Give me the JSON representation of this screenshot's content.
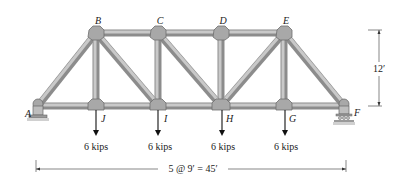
{
  "diagram": {
    "nodes": {
      "A": {
        "label": "A",
        "x": 38,
        "y": 106
      },
      "B": {
        "label": "B",
        "x": 96,
        "y": 33
      },
      "C": {
        "label": "C",
        "x": 158,
        "y": 33
      },
      "D": {
        "label": "D",
        "x": 221,
        "y": 33
      },
      "E": {
        "label": "E",
        "x": 284,
        "y": 33
      },
      "F": {
        "label": "F",
        "x": 344,
        "y": 106
      },
      "G": {
        "label": "G",
        "x": 284,
        "y": 106
      },
      "H": {
        "label": "H",
        "x": 221,
        "y": 106
      },
      "I": {
        "label": "I",
        "x": 158,
        "y": 106
      },
      "J": {
        "label": "J",
        "x": 96,
        "y": 106
      }
    },
    "members": [
      [
        "A",
        "B"
      ],
      [
        "B",
        "C"
      ],
      [
        "C",
        "D"
      ],
      [
        "D",
        "E"
      ],
      [
        "E",
        "F"
      ],
      [
        "A",
        "J"
      ],
      [
        "J",
        "I"
      ],
      [
        "I",
        "H"
      ],
      [
        "H",
        "G"
      ],
      [
        "G",
        "F"
      ],
      [
        "B",
        "J"
      ],
      [
        "C",
        "I"
      ],
      [
        "D",
        "H"
      ],
      [
        "E",
        "G"
      ],
      [
        "B",
        "I"
      ],
      [
        "C",
        "H"
      ],
      [
        "H",
        "E"
      ]
    ],
    "loads": [
      {
        "node": "J",
        "label": "6 kips"
      },
      {
        "node": "I",
        "label": "6 kips"
      },
      {
        "node": "H",
        "label": "6 kips"
      },
      {
        "node": "G",
        "label": "6 kips"
      }
    ],
    "supports": {
      "A": "pin",
      "F": "roller"
    },
    "dimensions": {
      "height_label": "12′",
      "span_label": "5 @ 9′ = 45′"
    }
  }
}
